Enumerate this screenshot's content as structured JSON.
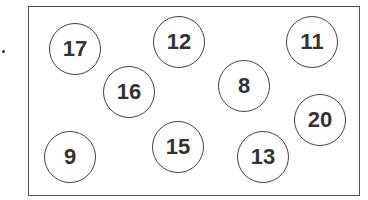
{
  "diagram": {
    "type": "numbered-circles-in-box",
    "circles": [
      {
        "label": "17",
        "x": 75,
        "y": 49
      },
      {
        "label": "12",
        "x": 179,
        "y": 42
      },
      {
        "label": "11",
        "x": 312,
        "y": 42
      },
      {
        "label": "16",
        "x": 129,
        "y": 92
      },
      {
        "label": "8",
        "x": 244,
        "y": 86
      },
      {
        "label": "20",
        "x": 320,
        "y": 120
      },
      {
        "label": "9",
        "x": 70,
        "y": 157
      },
      {
        "label": "15",
        "x": 178,
        "y": 147
      },
      {
        "label": "13",
        "x": 263,
        "y": 157
      }
    ]
  }
}
